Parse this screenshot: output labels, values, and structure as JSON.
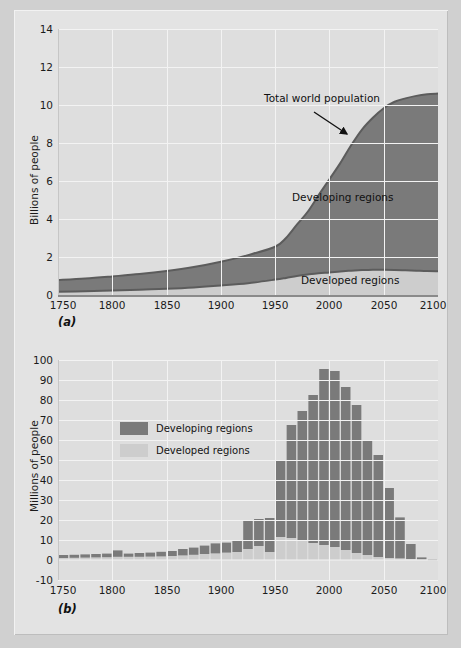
{
  "figure": {
    "background_color": "#d0d0d0",
    "board_color": "#e3e3e3",
    "plot_background_color": "#dedede",
    "grid_color": "#f3f3f3",
    "developing_color": "#7a7a7a",
    "developed_color": "#cdcdcd",
    "line_color": "#5c5c5c"
  },
  "panel_a": {
    "tag": "(a)",
    "ylabel": "Billions of people",
    "yticks": [
      "0",
      "2",
      "4",
      "6",
      "8",
      "10",
      "12",
      "14"
    ],
    "ytick_values": [
      0,
      2,
      4,
      6,
      8,
      10,
      12,
      14
    ],
    "xticks": [
      "1750",
      "1800",
      "1850",
      "1900",
      "1950",
      "2000",
      "2050",
      "2100"
    ],
    "xtick_values": [
      1750,
      1800,
      1850,
      1900,
      1950,
      2000,
      2050,
      2100
    ],
    "annotation_total": "Total world population",
    "label_developing": "Developing regions",
    "label_developed": "Developed regions"
  },
  "panel_b": {
    "tag": "(b)",
    "ylabel": "Millions of people",
    "yticks": [
      "-10",
      "0",
      "10",
      "20",
      "30",
      "40",
      "50",
      "60",
      "70",
      "80",
      "90",
      "100"
    ],
    "ytick_values": [
      -10,
      0,
      10,
      20,
      30,
      40,
      50,
      60,
      70,
      80,
      90,
      100
    ],
    "xticks": [
      "1750",
      "1800",
      "1850",
      "1900",
      "1950",
      "2000",
      "2050",
      "2100"
    ],
    "xtick_values": [
      1750,
      1800,
      1850,
      1900,
      1950,
      2000,
      2050,
      2100
    ],
    "legend": [
      {
        "label": "Developing regions",
        "color": "#7a7a7a"
      },
      {
        "label": "Developed regions",
        "color": "#cdcdcd"
      }
    ]
  },
  "chart_data": [
    {
      "type": "area",
      "id": "panel-a-stacked-area",
      "title": "World population, developed and developing regions, 1750-2100",
      "subtitle": "(a)",
      "xlabel": "",
      "ylabel": "Billions of people",
      "xlim": [
        1750,
        2100
      ],
      "ylim": [
        0,
        14
      ],
      "grid": true,
      "stacked": true,
      "annotations": [
        {
          "text": "Total world population",
          "x": 2010,
          "y": 11.4
        },
        {
          "text": "Developing regions",
          "x": 2042,
          "y": 5.3
        },
        {
          "text": "Developed regions",
          "x": 2048,
          "y": 0.72
        }
      ],
      "x": [
        1750,
        1775,
        1800,
        1825,
        1850,
        1875,
        1900,
        1925,
        1950,
        1960,
        1970,
        1980,
        1990,
        2000,
        2010,
        2020,
        2030,
        2040,
        2050,
        2060,
        2070,
        2080,
        2090,
        2100
      ],
      "series": [
        {
          "name": "Developed regions",
          "color": "#cdcdcd",
          "values": [
            0.17,
            0.2,
            0.24,
            0.28,
            0.33,
            0.4,
            0.5,
            0.62,
            0.81,
            0.9,
            1.0,
            1.08,
            1.15,
            1.19,
            1.24,
            1.28,
            1.31,
            1.33,
            1.33,
            1.32,
            1.3,
            1.28,
            1.26,
            1.25
          ]
        },
        {
          "name": "Developing regions",
          "color": "#7a7a7a",
          "values": [
            0.62,
            0.67,
            0.74,
            0.82,
            0.93,
            1.07,
            1.25,
            1.48,
            1.73,
            2.1,
            2.7,
            3.3,
            4.1,
            4.9,
            5.7,
            6.6,
            7.4,
            8.0,
            8.5,
            8.85,
            9.05,
            9.2,
            9.3,
            9.35
          ]
        }
      ],
      "totals": [
        0.79,
        0.87,
        0.98,
        1.1,
        1.26,
        1.47,
        1.75,
        2.1,
        2.54,
        3.0,
        3.7,
        4.38,
        5.25,
        6.09,
        6.94,
        7.88,
        8.71,
        9.33,
        9.83,
        10.17,
        10.35,
        10.48,
        10.56,
        10.6
      ]
    },
    {
      "type": "bar",
      "id": "panel-b-population-increase",
      "title": "Population increase by decade, developed and developing regions",
      "subtitle": "(b)",
      "xlabel": "",
      "ylabel": "Millions of people",
      "xlim": [
        1750,
        2100
      ],
      "ylim": [
        -10,
        100
      ],
      "grid": true,
      "stacked": true,
      "bar_interval_years": 10,
      "categories": [
        1750,
        1760,
        1770,
        1780,
        1790,
        1800,
        1810,
        1820,
        1830,
        1840,
        1850,
        1860,
        1870,
        1880,
        1890,
        1900,
        1910,
        1920,
        1930,
        1940,
        1950,
        1960,
        1970,
        1980,
        1990,
        2000,
        2010,
        2020,
        2030,
        2040,
        2050,
        2060,
        2070,
        2080,
        2090
      ],
      "series": [
        {
          "name": "Developed regions",
          "color": "#cdcdcd",
          "values": [
            1.0,
            1.1,
            1.2,
            1.3,
            1.4,
            1.6,
            1.6,
            1.6,
            1.7,
            1.8,
            2.0,
            2.3,
            2.6,
            3.0,
            3.3,
            3.7,
            4.0,
            5.5,
            7.0,
            4.0,
            11.5,
            11.0,
            10.0,
            8.5,
            7.5,
            6.5,
            5.0,
            3.5,
            2.5,
            1.5,
            1.0,
            0.8,
            0.5,
            0.3,
            -0.5
          ]
        },
        {
          "name": "Developing regions",
          "color": "#7a7a7a",
          "values": [
            1.5,
            1.5,
            1.6,
            1.7,
            1.8,
            3.2,
            1.6,
            1.9,
            2.0,
            2.3,
            2.5,
            3.2,
            3.6,
            4.2,
            5.0,
            5.0,
            5.5,
            14.0,
            13.5,
            17.0,
            38.5,
            56.5,
            64.5,
            74.0,
            88.0,
            88.0,
            81.5,
            74.0,
            57.5,
            51.0,
            35.0,
            20.5,
            7.5,
            1.0,
            0.3
          ]
        }
      ],
      "totals": [
        2.5,
        2.6,
        2.8,
        3.0,
        3.2,
        4.8,
        3.2,
        3.5,
        3.7,
        4.1,
        4.5,
        5.5,
        6.2,
        7.2,
        8.3,
        8.7,
        9.5,
        19.5,
        20.5,
        21.0,
        50.0,
        67.5,
        74.5,
        82.5,
        95.5,
        94.5,
        86.5,
        77.5,
        60.0,
        52.5,
        36.0,
        21.3,
        8.0,
        1.3,
        -0.2
      ]
    }
  ]
}
